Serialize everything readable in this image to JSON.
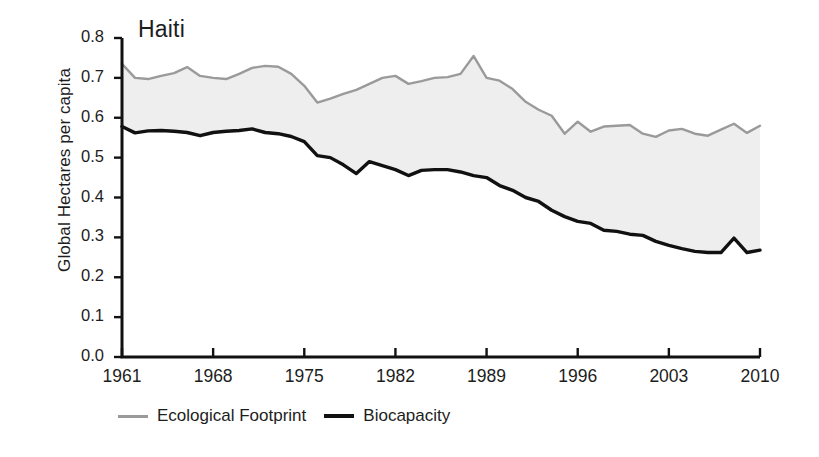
{
  "chart_data": {
    "type": "area",
    "title": "Haiti",
    "xlabel": "",
    "ylabel": "Global Hectares per capita",
    "xlim": [
      1961,
      2010
    ],
    "ylim": [
      0.0,
      0.8
    ],
    "grid": false,
    "legend_position": "below",
    "y_ticks": [
      "0.0",
      "0.1",
      "0.2",
      "0.3",
      "0.4",
      "0.5",
      "0.6",
      "0.7",
      "0.8"
    ],
    "y_tick_values": [
      0.0,
      0.1,
      0.2,
      0.3,
      0.4,
      0.5,
      0.6,
      0.7,
      0.8
    ],
    "x_ticks": [
      "1961",
      "1968",
      "1975",
      "1982",
      "1989",
      "1996",
      "2003",
      "2010"
    ],
    "x_tick_values": [
      1961,
      1968,
      1975,
      1982,
      1989,
      1996,
      2003,
      2010
    ],
    "x": [
      1961,
      1962,
      1963,
      1964,
      1965,
      1966,
      1967,
      1968,
      1969,
      1970,
      1971,
      1972,
      1973,
      1974,
      1975,
      1976,
      1977,
      1978,
      1979,
      1980,
      1981,
      1982,
      1983,
      1984,
      1985,
      1986,
      1987,
      1988,
      1989,
      1990,
      1991,
      1992,
      1993,
      1994,
      1995,
      1996,
      1997,
      1998,
      1999,
      2000,
      2001,
      2002,
      2003,
      2004,
      2005,
      2006,
      2007,
      2008,
      2009,
      2010
    ],
    "series": [
      {
        "name": "Ecological Footprint",
        "color": "#9a9a9a",
        "values": [
          0.735,
          0.7,
          0.697,
          0.705,
          0.712,
          0.727,
          0.705,
          0.7,
          0.697,
          0.71,
          0.725,
          0.73,
          0.728,
          0.71,
          0.68,
          0.638,
          0.648,
          0.66,
          0.67,
          0.685,
          0.7,
          0.705,
          0.685,
          0.692,
          0.7,
          0.702,
          0.71,
          0.755,
          0.7,
          0.693,
          0.672,
          0.64,
          0.62,
          0.605,
          0.56,
          0.59,
          0.565,
          0.578,
          0.58,
          0.582,
          0.56,
          0.552,
          0.568,
          0.572,
          0.56,
          0.555,
          0.57,
          0.585,
          0.562,
          0.58
        ]
      },
      {
        "name": "Biocapacity",
        "color": "#111111",
        "values": [
          0.578,
          0.562,
          0.567,
          0.568,
          0.566,
          0.563,
          0.555,
          0.563,
          0.566,
          0.568,
          0.572,
          0.563,
          0.56,
          0.553,
          0.54,
          0.505,
          0.5,
          0.482,
          0.46,
          0.49,
          0.48,
          0.47,
          0.455,
          0.468,
          0.47,
          0.47,
          0.464,
          0.455,
          0.45,
          0.43,
          0.418,
          0.4,
          0.39,
          0.368,
          0.352,
          0.34,
          0.335,
          0.318,
          0.315,
          0.308,
          0.305,
          0.29,
          0.28,
          0.272,
          0.265,
          0.262,
          0.262,
          0.298,
          0.262,
          0.268
        ]
      }
    ]
  },
  "legend": {
    "items": [
      {
        "label": "Ecological Footprint",
        "color": "#9a9a9a"
      },
      {
        "label": "Biocapacity",
        "color": "#111111"
      }
    ]
  },
  "axes": {
    "y_title": "Global Hectares per capita"
  }
}
